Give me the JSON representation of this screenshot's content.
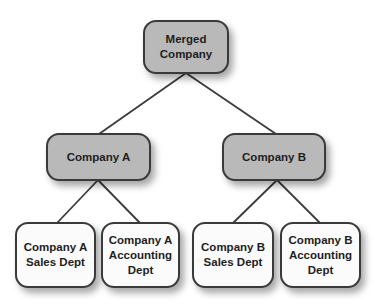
{
  "diagram": {
    "type": "org-chart",
    "colors": {
      "level1_fill": "#b9b9b9",
      "level2_fill": "#b9b9b9",
      "level3_fill": "#fbfbfb",
      "border": "#3a3a3a",
      "connector": "#3b3b3b",
      "text": "#1e1e1e"
    },
    "root": {
      "label": "Merged\nCompany"
    },
    "companies": [
      {
        "label": "Company A",
        "departments": [
          {
            "label": "Company A\nSales Dept"
          },
          {
            "label": "Company A\nAccounting\nDept"
          }
        ]
      },
      {
        "label": "Company B",
        "departments": [
          {
            "label": "Company B\nSales Dept"
          },
          {
            "label": "Company B\nAccounting\nDept"
          }
        ]
      }
    ],
    "edges": [
      {
        "from": "Merged Company",
        "to": "Company A"
      },
      {
        "from": "Merged Company",
        "to": "Company B"
      },
      {
        "from": "Company A",
        "to": "Company A Sales Dept"
      },
      {
        "from": "Company A",
        "to": "Company A Accounting Dept"
      },
      {
        "from": "Company B",
        "to": "Company B Sales Dept"
      },
      {
        "from": "Company B",
        "to": "Company B Accounting Dept"
      }
    ]
  }
}
